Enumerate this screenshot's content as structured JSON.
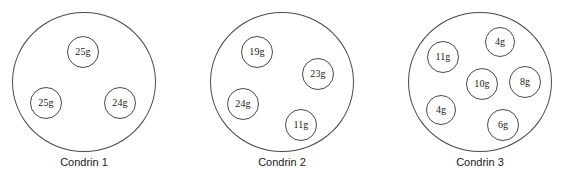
{
  "figure": {
    "title": "",
    "canvas": {
      "width": 567,
      "height": 189,
      "background": "#ffffff"
    },
    "stroke_color": "#4a4a4a",
    "text_color": "#1a1a1a",
    "unit": "g"
  },
  "chart_data": {
    "type": "diagram",
    "groups": [
      {
        "label": "Condrin 1",
        "container": {
          "cx": 84,
          "cy": 82,
          "rx": 72,
          "ry": 70
        },
        "label_pos": {
          "x": 84,
          "y": 160
        },
        "items": [
          {
            "value": "25g",
            "cx": 83,
            "cy": 52,
            "r": 16
          },
          {
            "value": "25g",
            "cx": 46,
            "cy": 103,
            "r": 16
          },
          {
            "value": "24g",
            "cx": 120,
            "cy": 103,
            "r": 16
          }
        ]
      },
      {
        "label": "Condrin 2",
        "container": {
          "cx": 282,
          "cy": 82,
          "rx": 72,
          "ry": 70
        },
        "label_pos": {
          "x": 282,
          "y": 160
        },
        "items": [
          {
            "value": "19g",
            "cx": 257,
            "cy": 52,
            "r": 16
          },
          {
            "value": "23g",
            "cx": 318,
            "cy": 74,
            "r": 16
          },
          {
            "value": "24g",
            "cx": 243,
            "cy": 104,
            "r": 16
          },
          {
            "value": "11g",
            "cx": 301,
            "cy": 125,
            "r": 16
          }
        ]
      },
      {
        "label": "Condrin 3",
        "container": {
          "cx": 480,
          "cy": 82,
          "rx": 72,
          "ry": 70
        },
        "label_pos": {
          "x": 480,
          "y": 160
        },
        "items": [
          {
            "value": "11g",
            "cx": 443,
            "cy": 57,
            "r": 16
          },
          {
            "value": "4g",
            "cx": 500,
            "cy": 42,
            "r": 15
          },
          {
            "value": "10g",
            "cx": 482,
            "cy": 84,
            "r": 16
          },
          {
            "value": "8g",
            "cx": 525,
            "cy": 82,
            "r": 16
          },
          {
            "value": "4g",
            "cx": 441,
            "cy": 110,
            "r": 15
          },
          {
            "value": "6g",
            "cx": 503,
            "cy": 125,
            "r": 16
          }
        ]
      }
    ]
  }
}
